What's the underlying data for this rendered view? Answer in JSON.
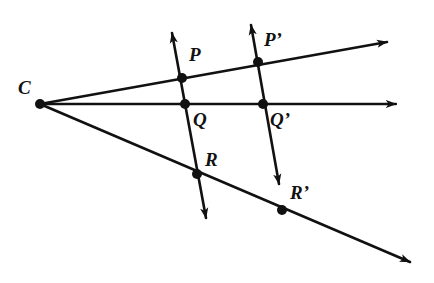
{
  "figure": {
    "kind": "geometry-diagram",
    "background_color": "#ffffff",
    "stroke_color": "#111111",
    "point_color": "#111111",
    "width": 434,
    "height": 283
  },
  "points": [
    {
      "id": "C",
      "label": "C",
      "x": 40,
      "y": 104,
      "dot": true,
      "dot_r": 5.0,
      "label_x": 18,
      "label_y": 78
    },
    {
      "id": "P",
      "label": "P",
      "x": 182,
      "y": 78,
      "dot": true,
      "dot_r": 5.0,
      "label_x": 189,
      "label_y": 45
    },
    {
      "id": "Q",
      "label": "Q",
      "x": 185,
      "y": 104,
      "dot": true,
      "dot_r": 5.0,
      "label_x": 193,
      "label_y": 110
    },
    {
      "id": "R",
      "label": "R",
      "x": 197,
      "y": 174,
      "dot": true,
      "dot_r": 5.0,
      "label_x": 205,
      "label_y": 150
    },
    {
      "id": "P1",
      "label": "P’",
      "x": 258,
      "y": 62,
      "dot": true,
      "dot_r": 5.0,
      "label_x": 264,
      "label_y": 30
    },
    {
      "id": "Q1",
      "label": "Q’",
      "x": 263,
      "y": 104,
      "dot": true,
      "dot_r": 5.0,
      "label_x": 270,
      "label_y": 110
    },
    {
      "id": "R1",
      "label": "R’",
      "x": 282,
      "y": 210,
      "dot": true,
      "dot_r": 5.0,
      "label_x": 290,
      "label_y": 183
    }
  ],
  "rays_from_center": [
    {
      "id": "ray-CP",
      "name": "ray-through-P-and-P-prime",
      "x1": 40,
      "y1": 104,
      "x2": 387,
      "y2": 42,
      "arrow": true
    },
    {
      "id": "ray-CQ",
      "name": "ray-through-Q-and-Q-prime",
      "x1": 40,
      "y1": 104,
      "x2": 396,
      "y2": 104,
      "arrow": true
    },
    {
      "id": "ray-CR",
      "name": "ray-through-R-and-R-prime",
      "x1": 40,
      "y1": 104,
      "x2": 410,
      "y2": 262,
      "arrow": true
    }
  ],
  "transversal_lines": [
    {
      "id": "line-PQR",
      "name": "line-through-P-Q-R",
      "x1": 172,
      "y1": 33,
      "x2": 206,
      "y2": 218,
      "arrow_start": true,
      "arrow_end": true
    },
    {
      "id": "line-PQR-pr",
      "name": "line-through-P-prime-Q-prime",
      "x1": 251,
      "y1": 25,
      "x2": 279,
      "y2": 184,
      "arrow_start": true,
      "arrow_end": true
    }
  ],
  "labels_text": {
    "C": "C",
    "P": "P",
    "Q": "Q",
    "R": "R",
    "P_prime": "P’",
    "Q_prime": "Q’",
    "R_prime": "R’"
  }
}
